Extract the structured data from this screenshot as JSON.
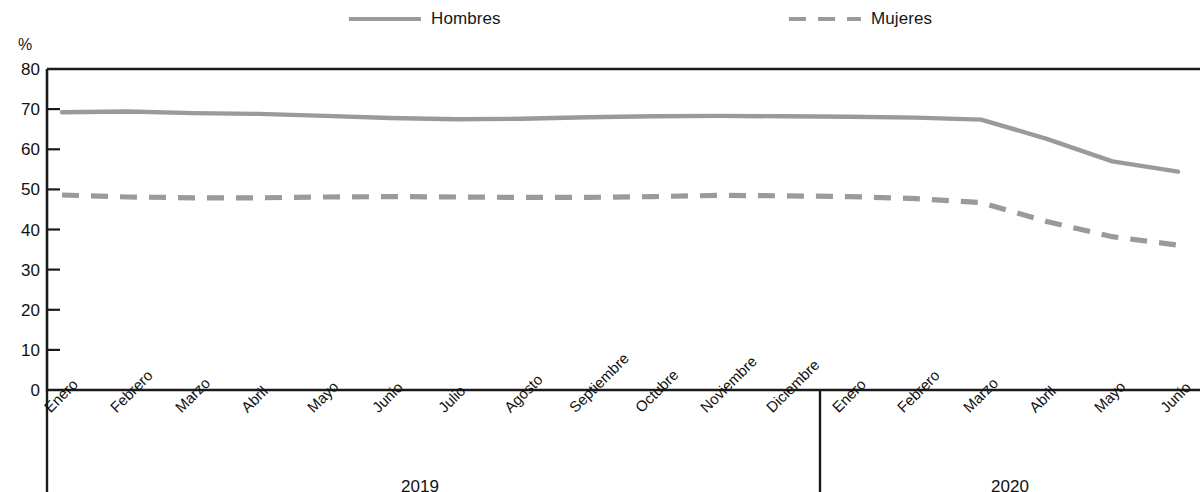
{
  "legend": {
    "items": [
      {
        "label": "Hombres",
        "style": "solid",
        "color": "#9a9a9a",
        "icon": "line-solid-icon"
      },
      {
        "label": "Mujeres",
        "style": "dashed",
        "color": "#9a9a9a",
        "icon": "line-dashed-icon"
      }
    ]
  },
  "axis": {
    "y_unit": "%",
    "y_ticks": [
      "80",
      "70",
      "60",
      "50",
      "40",
      "30",
      "20",
      "10",
      "0"
    ]
  },
  "years": [
    {
      "label": "2019",
      "center_x": 420
    },
    {
      "label": "2020",
      "center_x": 1010
    }
  ],
  "chart_data": {
    "type": "line",
    "title": "",
    "xlabel": "",
    "ylabel": "%",
    "ylim": [
      0,
      80
    ],
    "ytick_step": 10,
    "grid": false,
    "legend_position": "top",
    "x": [
      "Enero 2019",
      "Febrero 2019",
      "Marzo 2019",
      "Abril 2019",
      "Mayo 2019",
      "Junio 2019",
      "Julio 2019",
      "Agosto 2019",
      "Septiembre 2019",
      "Octubre 2019",
      "Noviembre 2019",
      "Diciembre 2019",
      "Enero 2020",
      "Febrero 2020",
      "Marzo 2020",
      "Abril 2020",
      "Mayo 2020",
      "Junio 2020"
    ],
    "categories": [
      "Enero",
      "Febrero",
      "Marzo",
      "Abril",
      "Mayo",
      "Junio",
      "Julio",
      "Agosto",
      "Septiembre",
      "Octubre",
      "Noviembre",
      "Diciembre",
      "Enero",
      "Febrero",
      "Marzo",
      "Abril",
      "Mayo",
      "Junio"
    ],
    "series": [
      {
        "name": "Hombres",
        "style": "solid",
        "color": "#9a9a9a",
        "values": [
          69.2,
          69.4,
          69.0,
          68.8,
          68.3,
          67.8,
          67.5,
          67.6,
          68.0,
          68.2,
          68.3,
          68.2,
          68.1,
          67.9,
          67.4,
          62.6,
          57.0,
          54.4
        ]
      },
      {
        "name": "Mujeres",
        "style": "dashed",
        "color": "#9a9a9a",
        "values": [
          48.6,
          48.1,
          47.9,
          47.9,
          48.1,
          48.2,
          48.1,
          48.0,
          48.0,
          48.2,
          48.5,
          48.4,
          48.2,
          47.7,
          46.7,
          42.0,
          38.2,
          36.1
        ]
      }
    ]
  },
  "x_axis_months_2019": [
    "Enero",
    "Febrero",
    "Marzo",
    "Abril",
    "Mayo",
    "Junio",
    "Julio",
    "Agosto",
    "Septiembre",
    "Octubre",
    "Noviembre",
    "Diciembre"
  ],
  "x_axis_months_2020": [
    "Enero",
    "Febrero",
    "Marzo",
    "Abril",
    "Mayo",
    "Junio"
  ]
}
